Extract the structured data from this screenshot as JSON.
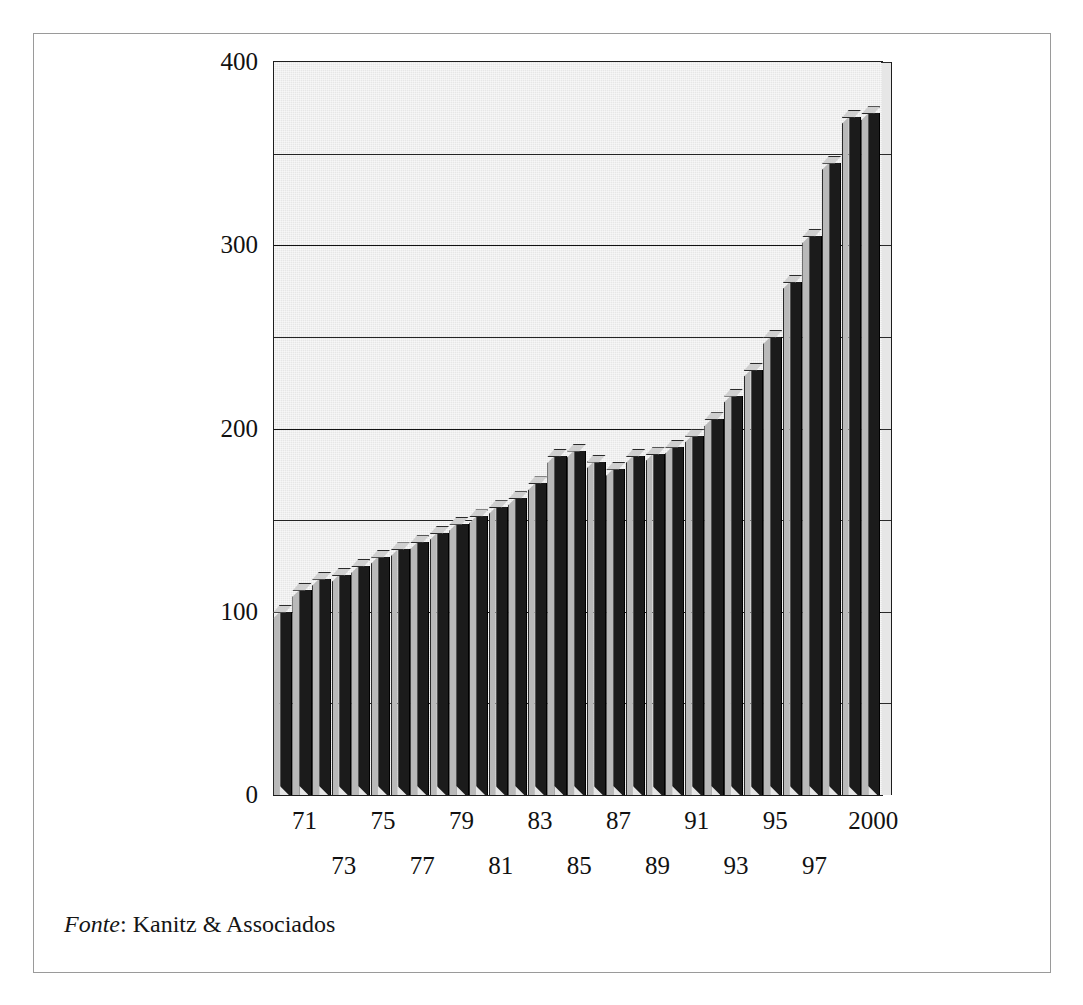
{
  "figure": {
    "source_prefix": "Fonte",
    "source_separator": ": ",
    "source_text": "Kanitz & Associados"
  },
  "colors": {
    "bar_face": "#1b1b1b",
    "bar_side": "#b9b9b9",
    "bar_top": "#cfcfcf",
    "plot_background": "#e6e6e6",
    "gridline": "#242424",
    "frame": "#9a9a9a",
    "text": "#111111"
  },
  "chart_data": {
    "type": "bar",
    "title": "",
    "subtitle": "",
    "xlabel": "",
    "ylabel": "",
    "ylim": [
      0,
      400
    ],
    "y_ticks": [
      0,
      50,
      100,
      150,
      200,
      250,
      300,
      350,
      400
    ],
    "y_tick_labels": [
      "0",
      "",
      "100",
      "",
      "200",
      "",
      "300",
      "",
      "400"
    ],
    "y_labeled_ticks": [
      0,
      100,
      200,
      300,
      400
    ],
    "grid": true,
    "grid_axis": "y",
    "legend": false,
    "legend_position": "none",
    "style": "3d-column",
    "categories": [
      "70",
      "71",
      "72",
      "73",
      "74",
      "75",
      "76",
      "77",
      "78",
      "79",
      "80",
      "81",
      "82",
      "83",
      "84",
      "85",
      "86",
      "87",
      "88",
      "89",
      "90",
      "91",
      "92",
      "93",
      "94",
      "95",
      "96",
      "97",
      "98",
      "99",
      "2000"
    ],
    "x_tick_labels_shown": [
      "71",
      "73",
      "75",
      "77",
      "79",
      "81",
      "83",
      "85",
      "87",
      "89",
      "91",
      "93",
      "95",
      "97",
      "2000"
    ],
    "x_tick_label_rows": [
      {
        "row": 0,
        "labels": [
          "71",
          "75",
          "79",
          "83",
          "87",
          "91",
          "95",
          "2000"
        ]
      },
      {
        "row": 1,
        "labels": [
          "73",
          "77",
          "81",
          "85",
          "89",
          "93",
          "97"
        ]
      }
    ],
    "values": [
      100,
      112,
      118,
      120,
      125,
      130,
      134,
      138,
      143,
      148,
      152,
      157,
      162,
      170,
      185,
      188,
      182,
      178,
      185,
      186,
      190,
      196,
      205,
      218,
      232,
      250,
      280,
      305,
      345,
      370,
      372
    ]
  }
}
